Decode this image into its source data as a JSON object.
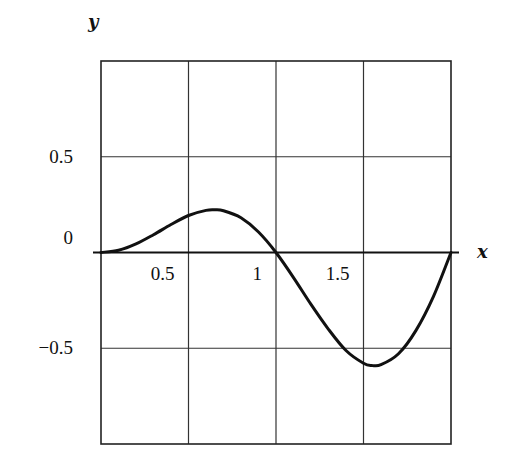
{
  "chart_data": {
    "type": "line",
    "title": "",
    "xlabel": "x",
    "ylabel": "y",
    "xlim": [
      0,
      2
    ],
    "ylim": [
      -1,
      1
    ],
    "grid": true,
    "legend": null,
    "x_ticks": [
      {
        "value": 0.5,
        "label": "0.5"
      },
      {
        "value": 1,
        "label": "1"
      },
      {
        "value": 1.5,
        "label": "1.5"
      }
    ],
    "y_ticks": [
      {
        "value": 0.5,
        "label": "0.5"
      },
      {
        "value": 0,
        "label": "0"
      },
      {
        "value": -0.5,
        "label": "−0.5"
      }
    ],
    "series": [
      {
        "name": "curve",
        "x": [
          0,
          0.1,
          0.2,
          0.3,
          0.4,
          0.5,
          0.6,
          0.65,
          0.7,
          0.8,
          0.9,
          1.0,
          1.1,
          1.2,
          1.3,
          1.4,
          1.5,
          1.55,
          1.6,
          1.7,
          1.8,
          1.9,
          2.0
        ],
        "y": [
          0,
          0.012,
          0.045,
          0.093,
          0.146,
          0.193,
          0.22,
          0.223,
          0.218,
          0.181,
          0.107,
          0,
          -0.131,
          -0.271,
          -0.401,
          -0.512,
          -0.578,
          -0.59,
          -0.586,
          -0.529,
          -0.407,
          -0.229,
          0
        ]
      }
    ]
  }
}
